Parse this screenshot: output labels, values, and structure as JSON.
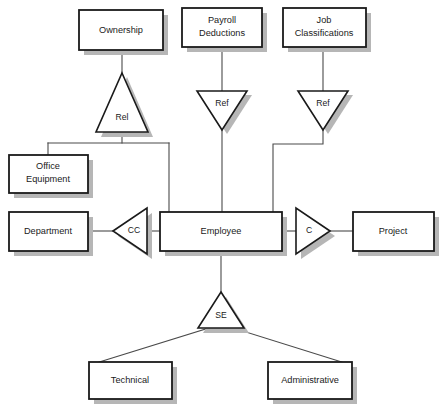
{
  "diagram": {
    "type": "entity-relationship-diagram",
    "canvas": {
      "width": 445,
      "height": 410,
      "background": "#ffffff"
    },
    "style": {
      "box_fill": "#ffffff",
      "box_stroke": "#1a1a1a",
      "shadow_color": "#b6b6b6",
      "connector_color": "#4a4a4a",
      "text_color": "#1a1a1a"
    },
    "entities": [
      {
        "id": "ownership",
        "label": "Ownership",
        "lines": [
          "Ownership"
        ],
        "x": 79,
        "y": 10,
        "w": 84,
        "h": 40
      },
      {
        "id": "payroll_deductions",
        "label": "Payroll Deductions",
        "lines": [
          "Payroll",
          "Deductions"
        ],
        "x": 182,
        "y": 8,
        "w": 80,
        "h": 39
      },
      {
        "id": "job_classifications",
        "label": "Job Classifications",
        "lines": [
          "Job",
          "Classifications"
        ],
        "x": 283,
        "y": 8,
        "w": 83,
        "h": 39
      },
      {
        "id": "office_equipment",
        "label": "Office Equipment",
        "lines": [
          "Office",
          "Equipment"
        ],
        "x": 9,
        "y": 155,
        "w": 79,
        "h": 38
      },
      {
        "id": "department",
        "label": "Department",
        "lines": [
          "Department"
        ],
        "x": 9,
        "y": 212,
        "w": 79,
        "h": 39
      },
      {
        "id": "employee",
        "label": "Employee",
        "lines": [
          "Employee"
        ],
        "x": 160,
        "y": 212,
        "w": 122,
        "h": 39
      },
      {
        "id": "project",
        "label": "Project",
        "lines": [
          "Project"
        ],
        "x": 353,
        "y": 212,
        "w": 81,
        "h": 39
      },
      {
        "id": "technical",
        "label": "Technical",
        "lines": [
          "Technical"
        ],
        "x": 89,
        "y": 362,
        "w": 83,
        "h": 37
      },
      {
        "id": "administrative",
        "label": "Administrative",
        "lines": [
          "Administrative"
        ],
        "x": 268,
        "y": 362,
        "w": 84,
        "h": 37
      }
    ],
    "relationships": [
      {
        "id": "rel",
        "label": "Rel",
        "orientation": "up",
        "cx": 122,
        "cy": 112,
        "half_w": 26,
        "h": 40
      },
      {
        "id": "ref_payroll",
        "label": "Ref",
        "orientation": "down",
        "cx": 222,
        "cy": 110,
        "half_w": 25,
        "h": 39
      },
      {
        "id": "ref_job",
        "label": "Ref",
        "orientation": "down",
        "cx": 323,
        "cy": 110,
        "half_w": 25,
        "h": 39
      },
      {
        "id": "cc",
        "label": "CC",
        "orientation": "left",
        "cx": 130,
        "cy": 231,
        "half_h": 23,
        "w": 34
      },
      {
        "id": "c",
        "label": "C",
        "orientation": "right",
        "cx": 313,
        "cy": 231,
        "half_h": 23,
        "w": 34
      },
      {
        "id": "se",
        "label": "SE",
        "orientation": "up",
        "cx": 221,
        "cy": 310,
        "half_w": 23,
        "h": 36
      }
    ],
    "connectors": [
      {
        "id": "ownership-to-rel",
        "from": "ownership",
        "to": "rel"
      },
      {
        "id": "rel-to-office-equipment",
        "from": "rel",
        "to": "office_equipment"
      },
      {
        "id": "rel-to-employee",
        "from": "rel",
        "to": "employee"
      },
      {
        "id": "payroll-to-ref",
        "from": "payroll_deductions",
        "to": "ref_payroll"
      },
      {
        "id": "ref-to-employee",
        "from": "ref_payroll",
        "to": "employee"
      },
      {
        "id": "job-classifications-to-ref",
        "from": "job_classifications",
        "to": "ref_job"
      },
      {
        "id": "ref-job-to-employee",
        "from": "ref_job",
        "to": "employee"
      },
      {
        "id": "department-to-cc",
        "from": "department",
        "to": "cc"
      },
      {
        "id": "cc-to-employee",
        "from": "cc",
        "to": "employee"
      },
      {
        "id": "employee-to-c",
        "from": "employee",
        "to": "c"
      },
      {
        "id": "c-to-project",
        "from": "c",
        "to": "project"
      },
      {
        "id": "employee-to-se",
        "from": "employee",
        "to": "se"
      },
      {
        "id": "se-to-technical",
        "from": "se",
        "to": "technical"
      },
      {
        "id": "se-to-administrative",
        "from": "se",
        "to": "administrative"
      }
    ]
  }
}
